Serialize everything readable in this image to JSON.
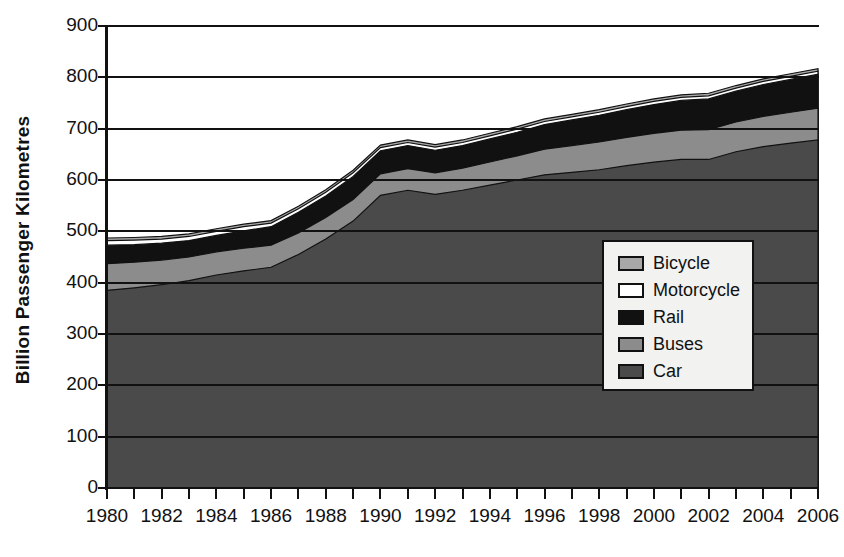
{
  "chart_data": {
    "type": "area",
    "title": "",
    "xlabel": "",
    "ylabel": "Billion Passenger Kilometres",
    "stacked": true,
    "grid": true,
    "legend_position": "inside-right",
    "xlim": [
      1980,
      2006
    ],
    "ylim": [
      0,
      900
    ],
    "yticks": [
      0,
      100,
      200,
      300,
      400,
      500,
      600,
      700,
      800,
      900
    ],
    "x": [
      1980,
      1981,
      1982,
      1983,
      1984,
      1985,
      1986,
      1987,
      1988,
      1989,
      1990,
      1991,
      1992,
      1993,
      1994,
      1995,
      1996,
      1997,
      1998,
      1999,
      2000,
      2001,
      2002,
      2003,
      2004,
      2005,
      2006
    ],
    "xtick_labels": [
      "1980",
      "1982",
      "1984",
      "1986",
      "1988",
      "1990",
      "1992",
      "1994",
      "1996",
      "1998",
      "2000",
      "2002",
      "2004",
      "2006"
    ],
    "xtick_years": [
      1980,
      1982,
      1984,
      1986,
      1988,
      1990,
      1992,
      1994,
      1996,
      1998,
      2000,
      2002,
      2004,
      2006
    ],
    "series": [
      {
        "name": "Car",
        "color": "#4a4a4a",
        "values": [
          385,
          390,
          396,
          404,
          415,
          423,
          430,
          455,
          485,
          520,
          570,
          580,
          572,
          580,
          590,
          600,
          610,
          615,
          620,
          628,
          635,
          640,
          640,
          655,
          665,
          672,
          678
        ]
      },
      {
        "name": "Buses",
        "color": "#8c8c8c",
        "values": [
          52,
          50,
          48,
          46,
          45,
          44,
          43,
          42,
          42,
          42,
          42,
          42,
          42,
          43,
          45,
          47,
          50,
          52,
          54,
          55,
          56,
          57,
          58,
          58,
          59,
          60,
          62
        ]
      },
      {
        "name": "Rail",
        "color": "#111111",
        "values": [
          36,
          34,
          33,
          32,
          32,
          34,
          36,
          40,
          42,
          45,
          45,
          45,
          44,
          44,
          45,
          46,
          48,
          50,
          52,
          54,
          56,
          58,
          60,
          60,
          62,
          64,
          66
        ]
      },
      {
        "name": "Motorcycle",
        "color": "#ffffff",
        "values": [
          9,
          9,
          8,
          8,
          8,
          8,
          7,
          7,
          7,
          7,
          6,
          6,
          6,
          6,
          6,
          6,
          6,
          6,
          6,
          6,
          6,
          6,
          6,
          6,
          6,
          6,
          6
        ]
      },
      {
        "name": "Bicycle",
        "color": "#a8a8a8",
        "values": [
          5,
          5,
          5,
          5,
          5,
          5,
          5,
          5,
          5,
          5,
          5,
          5,
          5,
          5,
          5,
          5,
          5,
          5,
          5,
          5,
          5,
          5,
          5,
          5,
          5,
          5,
          5
        ]
      }
    ],
    "totals": [
      487,
      488,
      490,
      495,
      505,
      514,
      521,
      549,
      581,
      619,
      668,
      678,
      669,
      678,
      691,
      704,
      719,
      728,
      737,
      748,
      758,
      766,
      769,
      784,
      797,
      807,
      817
    ]
  },
  "legend": {
    "items": [
      {
        "label": "Bicycle",
        "color": "#a8a8a8"
      },
      {
        "label": "Motorcycle",
        "color": "#ffffff"
      },
      {
        "label": "Rail",
        "color": "#111111"
      },
      {
        "label": "Buses",
        "color": "#8c8c8c"
      },
      {
        "label": "Car",
        "color": "#4a4a4a"
      }
    ]
  }
}
